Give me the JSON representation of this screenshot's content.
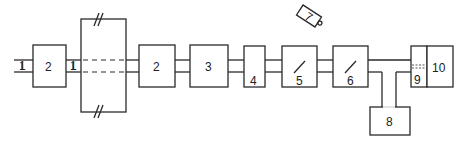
{
  "diagram": {
    "type": "block-diagram",
    "labels": {
      "pipe_inlet": "1",
      "pipe_inner": "1",
      "box_2a": "2",
      "box_2b": "2",
      "box_3": "3",
      "box_4": "4",
      "box_5": "5",
      "box_6": "6",
      "item_7": "7",
      "box_8": "8",
      "box_9": "9",
      "box_10": "10"
    },
    "colors": {
      "stroke": "#2a2a2a",
      "background": "#ffffff"
    }
  }
}
